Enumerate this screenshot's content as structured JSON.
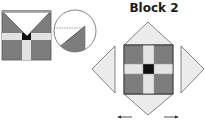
{
  "figure": {
    "title": "Block 2",
    "colors": {
      "dark": "#7d7d7d",
      "light": "#e6e6e6",
      "center": "#111111",
      "outline": "#555555",
      "triangle": "#ececec",
      "arrow": "#222222",
      "dashed": "#888888"
    },
    "left_block": {
      "label": ""
    },
    "detail_circle": {
      "label": ""
    },
    "arrows": [
      "left-arrow",
      "right-arrow"
    ]
  }
}
